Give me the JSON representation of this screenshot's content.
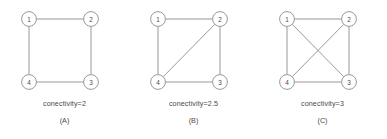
{
  "figure": {
    "background_color": "#ffffff",
    "stroke_color": "#8d8d8d",
    "text_color": "#4a4a4a"
  },
  "chart_data": {
    "type": "diagram",
    "title": "",
    "node_labels": [
      "1",
      "2",
      "3",
      "4"
    ],
    "node_positions": {
      "1": [
        29,
        19
      ],
      "2": [
        91,
        19
      ],
      "3": [
        91,
        82
      ],
      "4": [
        29,
        82
      ]
    },
    "panels": [
      {
        "id": "A",
        "panel_label": "(A)",
        "caption": "conectivity=2",
        "connectivity_value": 2,
        "nodes": [
          "1",
          "2",
          "3",
          "4"
        ],
        "edges": [
          [
            "1",
            "2"
          ],
          [
            "2",
            "3"
          ],
          [
            "3",
            "4"
          ],
          [
            "4",
            "1"
          ]
        ]
      },
      {
        "id": "B",
        "panel_label": "(B)",
        "caption": "conectivity=2.5",
        "connectivity_value": 2.5,
        "nodes": [
          "1",
          "2",
          "3",
          "4"
        ],
        "edges": [
          [
            "1",
            "2"
          ],
          [
            "2",
            "3"
          ],
          [
            "3",
            "4"
          ],
          [
            "4",
            "1"
          ],
          [
            "4",
            "2"
          ]
        ]
      },
      {
        "id": "C",
        "panel_label": "(C)",
        "caption": "conectivity=3",
        "connectivity_value": 3,
        "nodes": [
          "1",
          "2",
          "3",
          "4"
        ],
        "edges": [
          [
            "1",
            "2"
          ],
          [
            "2",
            "3"
          ],
          [
            "3",
            "4"
          ],
          [
            "4",
            "1"
          ],
          [
            "4",
            "2"
          ],
          [
            "1",
            "3"
          ]
        ]
      }
    ]
  }
}
